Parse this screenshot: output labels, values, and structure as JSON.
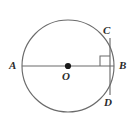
{
  "figure": {
    "type": "circle-geometry-diagram",
    "background_color": "#ffffff",
    "stroke_color": "#6b6b6b",
    "label_color": "#2b2b2b",
    "center_dot_color": "#1a1a1a"
  },
  "labels": {
    "a": "A",
    "b": "B",
    "c": "C",
    "d": "D",
    "o": "O"
  },
  "geometry": {
    "circle": {
      "cx": 68,
      "cy": 66,
      "r": 46
    },
    "diameter_ab": {
      "x1": 22,
      "y1": 66,
      "x2": 114,
      "y2": 66
    },
    "chord_cd": {
      "x1": 110,
      "y1": 38,
      "x2": 110,
      "y2": 95
    },
    "center_point": {
      "cx": 68,
      "cy": 66,
      "r": 3.1
    },
    "right_angle_mark": {
      "x": 100,
      "y": 56,
      "size": 10
    }
  }
}
